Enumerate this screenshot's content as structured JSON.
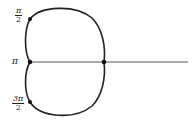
{
  "diagram": {
    "type": "polar cardioid",
    "curve": "r = 1 - cos(theta)",
    "labels": {
      "pi_over_2": {
        "num": "π",
        "den": "2"
      },
      "pi": "π",
      "three_pi_over_2": {
        "num": "3π",
        "den": "2"
      }
    },
    "points": [
      "θ = π/2",
      "θ = π",
      "θ = 3π/2",
      "θ = 0"
    ],
    "colors": {
      "curve": "#222222",
      "axis": "#555555"
    }
  }
}
